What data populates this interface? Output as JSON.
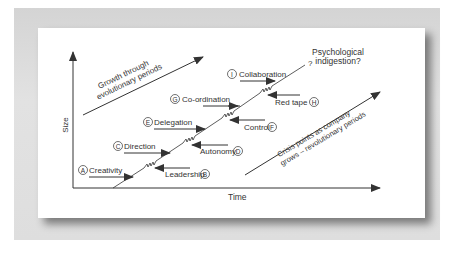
{
  "diagram": {
    "axes": {
      "y_label": "Size",
      "x_label": "Time"
    },
    "annotations": {
      "growth_arrow": [
        "Growth through",
        "evolutionary periods"
      ],
      "crisis_arrow": [
        "Crisis points as company",
        "grows – revolutionary periods"
      ],
      "question_mark": "?",
      "psych": [
        "Psychological",
        "indigestion?"
      ]
    },
    "phases": [
      {
        "letter": "A",
        "label": "Creativity",
        "direction": "in"
      },
      {
        "letter": "B",
        "label": "Leadership",
        "direction": "crisis"
      },
      {
        "letter": "C",
        "label": "Direction",
        "direction": "in"
      },
      {
        "letter": "D",
        "label": "Autonomy",
        "direction": "crisis"
      },
      {
        "letter": "E",
        "label": "Delegation",
        "direction": "in"
      },
      {
        "letter": "F",
        "label": "Control",
        "direction": "crisis"
      },
      {
        "letter": "G",
        "label": "Co-ordination",
        "direction": "in"
      },
      {
        "letter": "H",
        "label": "Red tape",
        "direction": "crisis"
      },
      {
        "letter": "I",
        "label": "Collaboration",
        "direction": "in"
      }
    ],
    "colors": {
      "frame": "#d8d8d8",
      "line": "#333333",
      "card": "#ffffff"
    }
  }
}
